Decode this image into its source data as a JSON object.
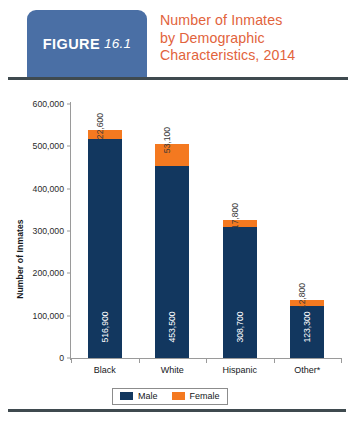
{
  "figure": {
    "badge_word": "FIGURE",
    "badge_number": "16.1",
    "title_lines": [
      "Number of Inmates",
      "by Demographic",
      "Characteristics, 2014"
    ],
    "badge_color": "#4A6FA5",
    "title_color": "#E2633C",
    "rule_color": "#3F4A4F"
  },
  "chart_data": {
    "type": "bar",
    "stacked": true,
    "title": "Number of Inmates by Demographic Characteristics, 2014",
    "xlabel": "",
    "ylabel": "Number of Inmates",
    "categories": [
      "Black",
      "White",
      "Hispanic",
      "Other*"
    ],
    "ylim": [
      0,
      600000
    ],
    "ytick_labels": [
      "0",
      "100,000",
      "200,000",
      "300,000",
      "400,000",
      "500,000",
      "600,000"
    ],
    "ytick_values": [
      0,
      100000,
      200000,
      300000,
      400000,
      500000,
      600000
    ],
    "grid": false,
    "legend_position": "bottom",
    "series": [
      {
        "name": "Male",
        "color": "#12375F",
        "values": [
          516900,
          453500,
          308700,
          123300
        ],
        "labels": [
          "516,900",
          "453,500",
          "308,700",
          "123,300"
        ]
      },
      {
        "name": "Female",
        "color": "#F47920",
        "values": [
          22600,
          53100,
          17800,
          12800
        ],
        "labels": [
          "22,600",
          "53,100",
          "17,800",
          "12,800"
        ]
      }
    ]
  }
}
